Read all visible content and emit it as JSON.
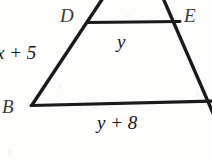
{
  "figure": {
    "type": "geometry-diagram",
    "background_color": "#fdfdfc",
    "stroke_color": "#1a1a1a",
    "vertices": [
      {
        "name": "D",
        "label": "D",
        "x": 88,
        "y": 22
      },
      {
        "name": "E",
        "label": "E",
        "x": 177,
        "y": 22
      },
      {
        "name": "B",
        "label": "B",
        "x": 32,
        "y": 105
      }
    ],
    "segments": [
      {
        "name": "left-side",
        "from": [
          103,
          0
        ],
        "to": [
          32,
          105
        ]
      },
      {
        "name": "right-side",
        "from": [
          163,
          0
        ],
        "to": [
          212,
          112
        ]
      },
      {
        "name": "midsegment-DE",
        "from": [
          88,
          22
        ],
        "to": [
          179,
          22
        ]
      },
      {
        "name": "base-BC",
        "from": [
          32,
          105
        ],
        "to": [
          212,
          101
        ]
      }
    ],
    "labels": {
      "vertex_D": "D",
      "vertex_E": "E",
      "vertex_B": "B",
      "left_side_measure": "x + 5",
      "midsegment_measure": "y",
      "base_measure": "y + 8"
    }
  }
}
